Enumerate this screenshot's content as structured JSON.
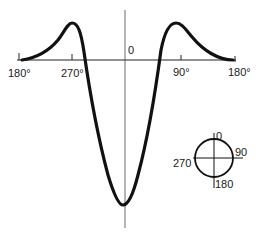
{
  "figure": {
    "curve": {
      "x_axis_labels": [
        {
          "text": "180°",
          "x": 28,
          "y": 77
        },
        {
          "text": "270°",
          "x": 72,
          "y": 77
        },
        {
          "text": "0",
          "x": 130,
          "y": 54
        },
        {
          "text": "90°",
          "x": 181,
          "y": 76
        },
        {
          "text": "180°",
          "x": 231,
          "y": 76
        }
      ],
      "description": "Symmetric curve: small positive lobes near 270° and 90°, deep negative minimum at 0°, tails to zero at ±180°",
      "color": "#111111"
    },
    "orientation_key": {
      "labels": {
        "top": "0",
        "right": "90",
        "bottom": "180",
        "left": "270"
      }
    }
  }
}
